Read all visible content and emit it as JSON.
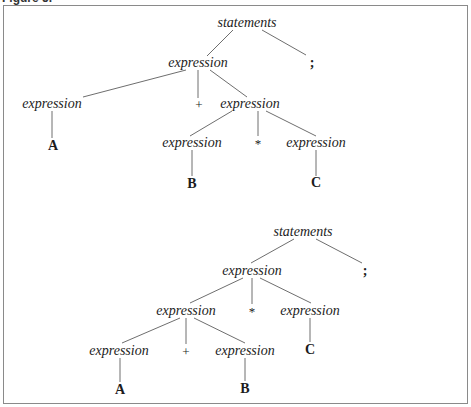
{
  "caption": "Figure 5.",
  "trees": [
    {
      "name": "parse-tree-1",
      "description": "A + (B * C)",
      "nodes": {
        "root": "statements",
        "expr": "expression",
        "semi": ";",
        "expr_l": "expression",
        "plus": "+",
        "expr_r": "expression",
        "a": "A",
        "expr_rl": "expression",
        "star": "*",
        "expr_rr": "expression",
        "b": "B",
        "c": "C"
      }
    },
    {
      "name": "parse-tree-2",
      "description": "(A + B) * C",
      "nodes": {
        "root": "statements",
        "expr": "expression",
        "semi": ";",
        "expr_l": "expression",
        "star": "*",
        "expr_r": "expression",
        "expr_ll": "expression",
        "plus": "+",
        "expr_lr": "expression",
        "c": "C",
        "a": "A",
        "b": "B"
      }
    }
  ],
  "colors": {
    "line": "#6e6e6e",
    "text": "#1c1c1c",
    "frame": "#8a8a8a"
  }
}
